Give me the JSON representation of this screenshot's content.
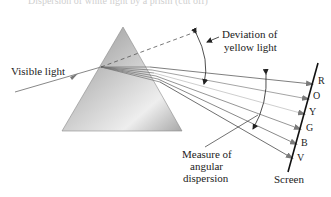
{
  "title_partial": "Dispersion of white light by a prism (cut off)",
  "labels": {
    "visible_light": "Visible light",
    "deviation_line1": "Deviation of",
    "deviation_line2": "yellow light",
    "measure_line1": "Measure of",
    "measure_line2": "angular",
    "measure_line3": "dispersion",
    "screen": "Screen"
  },
  "spectrum": [
    {
      "letter": "R",
      "color": "#7a7a7a"
    },
    {
      "letter": "O",
      "color": "#9a9a9a"
    },
    {
      "letter": "Y",
      "color": "#c4c4c4"
    },
    {
      "letter": "G",
      "color": "#8a8a8a"
    },
    {
      "letter": "B",
      "color": "#7c7c7c"
    },
    {
      "letter": "V",
      "color": "#6a6a6a"
    }
  ],
  "colors": {
    "prism_light": "#e6e6e6",
    "prism_dark": "#9a9a9a",
    "line": "#333333",
    "incoming_ray": "#888888"
  }
}
